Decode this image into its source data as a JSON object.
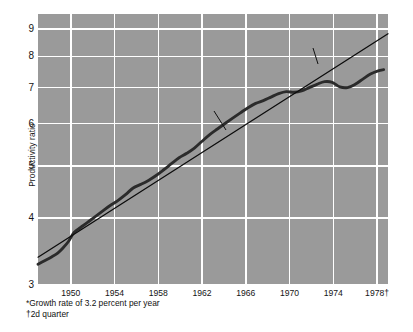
{
  "chart_data": {
    "type": "line",
    "title": "",
    "subtitle": "",
    "xlabel": "",
    "ylabel": "Productivity ratio",
    "yscale": "log",
    "ylim": [
      3,
      9.6
    ],
    "xlim": [
      1947,
      1979
    ],
    "grid": true,
    "legend_position": "none",
    "y_ticks": [
      "3",
      "4",
      "5",
      "6",
      "7",
      "8",
      "9"
    ],
    "y_tick_values": [
      3,
      4,
      5,
      6,
      7,
      8,
      9
    ],
    "x_ticks": [
      "1950",
      "1954",
      "1958",
      "1962",
      "1966",
      "1970",
      "1974",
      "1978†"
    ],
    "x_tick_values": [
      1950,
      1954,
      1958,
      1962,
      1966,
      1970,
      1974,
      1978
    ],
    "series": [
      {
        "name": "Actual productivity",
        "style": "thick-dark-curve",
        "color": "#2b2b2b",
        "x": [
          1947.0,
          1947.6,
          1948.2,
          1948.8,
          1949.3,
          1949.8,
          1950.3,
          1950.9,
          1951.5,
          1952.2,
          1952.9,
          1953.6,
          1954.3,
          1955.0,
          1955.7,
          1956.4,
          1957.1,
          1957.8,
          1958.5,
          1959.2,
          1959.9,
          1960.6,
          1961.3,
          1962.0,
          1962.7,
          1963.4,
          1964.1,
          1964.8,
          1965.5,
          1966.2,
          1966.9,
          1967.6,
          1968.3,
          1969.0,
          1969.7,
          1970.4,
          1971.1,
          1971.8,
          1972.5,
          1973.2,
          1973.9,
          1974.6,
          1975.3,
          1976.0,
          1976.7,
          1977.4,
          1978.1,
          1978.6
        ],
        "y": [
          3.28,
          3.33,
          3.38,
          3.44,
          3.52,
          3.62,
          3.76,
          3.84,
          3.92,
          4.02,
          4.12,
          4.22,
          4.31,
          4.42,
          4.55,
          4.62,
          4.7,
          4.8,
          4.92,
          5.05,
          5.18,
          5.28,
          5.4,
          5.56,
          5.72,
          5.86,
          6.0,
          6.14,
          6.28,
          6.42,
          6.54,
          6.62,
          6.72,
          6.82,
          6.88,
          6.86,
          6.9,
          7.0,
          7.1,
          7.18,
          7.16,
          7.02,
          7.0,
          7.1,
          7.26,
          7.42,
          7.52,
          7.56
        ]
      },
      {
        "name": "Trend rate 1947–67*",
        "style": "thin-straight-line",
        "color": "#0b0b0b",
        "growth_rate_percent": 3.2,
        "x": [
          1947.0,
          1979.0
        ],
        "y": [
          3.38,
          8.82
        ]
      }
    ],
    "annotations": [
      {
        "name": "actual-productivity-annotation",
        "text": "Actual productivity",
        "x": 1958.0,
        "y": 6.2
      },
      {
        "name": "trend-rate-annotation",
        "text": "Trend rate 1947–67*",
        "x": 1968.2,
        "y": 8.55
      }
    ],
    "footnotes": [
      "*Growth rate of 3.2 percent per year",
      "†2d quarter"
    ],
    "colors": {
      "plot_background": "#9a9a9a",
      "gridline": "#ffffff",
      "actual_line": "#2b2b2b",
      "trend_line": "#0b0b0b",
      "page_background": "#ffffff",
      "text": "#141414"
    }
  },
  "axis": {
    "y_title": "Productivity ratio"
  }
}
